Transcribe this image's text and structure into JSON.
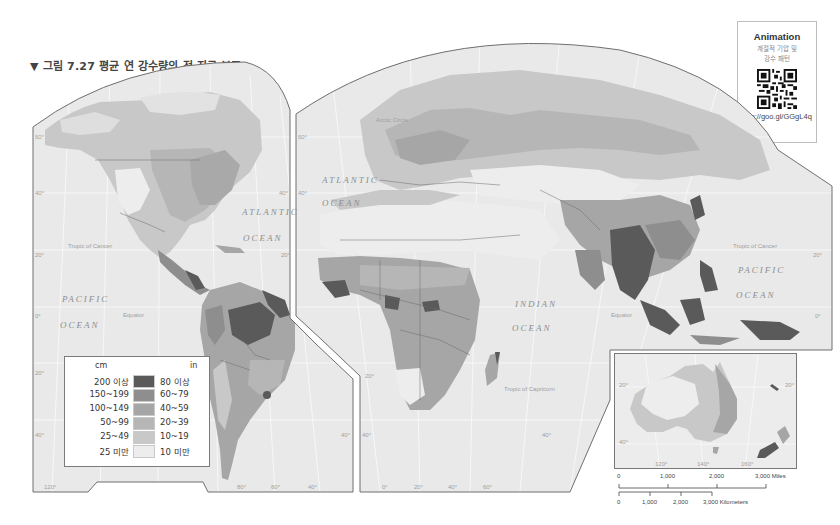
{
  "figure": {
    "title": "▼ 그림 7.27  평균 연 강수량의 전 지구 분포"
  },
  "animation_box": {
    "title": "Animation",
    "subtitle_line1": "계절적 기압 및",
    "subtitle_line2": "강수 패턴",
    "qr_icon": "qr-code-icon",
    "url": "http://goo.gl/GGgL4q"
  },
  "legend": {
    "unit_left": "cm",
    "unit_right": "in",
    "rows": [
      {
        "cm": "200 이상",
        "in": "80 이상",
        "color": "#5a5a5a"
      },
      {
        "cm": "150~199",
        "in": "60~79",
        "color": "#8e8e8e"
      },
      {
        "cm": "100~149",
        "in": "40~59",
        "color": "#a6a6a6"
      },
      {
        "cm": "50~99",
        "in": "20~39",
        "color": "#b6b6b6"
      },
      {
        "cm": "25~49",
        "in": "10~19",
        "color": "#c8c8c8"
      },
      {
        "cm": "25 미만",
        "in": "10 미만",
        "color": "#ededed"
      }
    ]
  },
  "map_labels": {
    "oceans": {
      "atlantic_west_1": "ATLANTIC",
      "atlantic_west_2": "OCEAN",
      "atlantic_east_1": "ATLANTIC",
      "atlantic_east_2": "OCEAN",
      "pacific_east_1": "PACIFIC",
      "pacific_east_2": "OCEAN",
      "pacific_west_1": "PACIFIC",
      "pacific_west_2": "OCEAN",
      "indian_1": "INDIAN",
      "indian_2": "OCEAN"
    },
    "lines": {
      "arctic_circle": "Arctic Circle",
      "tropic_cancer_left": "Tropic of Cancer",
      "tropic_cancer_right": "Tropic of Cancer",
      "equator_left": "Equator",
      "equator_right": "Equator",
      "tropic_capricorn": "Tropic of Capricorn"
    },
    "latitudes": {
      "lat60_left": "60°",
      "lat40_left": "40°",
      "lat40_mid": "40°",
      "lat20_left": "20°",
      "lat20_mid": "20°",
      "lat0_left": "0°",
      "lat20s_left": "20°",
      "lat40s_left": "40°",
      "lat40s_mid": "40°",
      "lat40s_mid2": "40°",
      "lat40s_right": "40°",
      "lat40_right": "40°",
      "lat60_right": "60°",
      "lat20_right": "20°",
      "lat0_right": "0°",
      "lat20s_right": "20°",
      "lat20s_africa": "20°"
    },
    "longitudes": {
      "lon120w": "120°",
      "lon80w": "80°",
      "lon60w": "60°",
      "lon40w": "40°",
      "lon0": "0°",
      "lon20e": "20°",
      "lon40e": "40°",
      "lon60e": "60°"
    }
  },
  "inset": {
    "region": "Australia / New Zealand",
    "lat20": "20°",
    "lat20_right": "20°",
    "lat40": "40°",
    "lon120": "120°",
    "lon140": "140°",
    "lon160": "160°"
  },
  "scale_bar": {
    "miles": [
      "0",
      "1,000",
      "2,000",
      "3,000 Miles"
    ],
    "kilometers": [
      "0",
      "1,000",
      "2,000",
      "3,000 Kilometers"
    ]
  }
}
